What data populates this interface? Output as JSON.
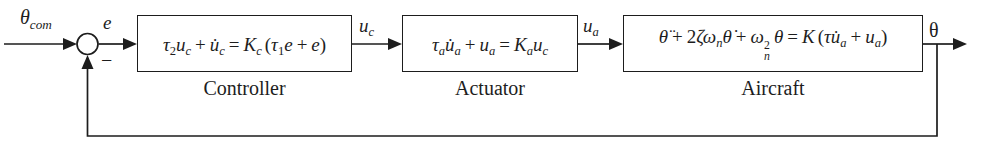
{
  "figure": {
    "background": "#ffffff",
    "ink": "#1d1d1d",
    "summing_junction": {
      "minus_label": "−"
    },
    "signals": {
      "input": {
        "tokens": [
          {
            "t": "θ",
            "sub": "com"
          }
        ]
      },
      "error": "e",
      "uc": {
        "tokens": [
          {
            "t": "u",
            "sub": "c"
          }
        ]
      },
      "ua": {
        "tokens": [
          {
            "t": "u",
            "sub": "a"
          }
        ]
      },
      "output": "θ"
    },
    "blocks": [
      {
        "name": "Controller",
        "equation": [
          {
            "t": "τ",
            "sub": "2"
          },
          {
            "t": "u",
            "sub": "c"
          },
          {
            "t": "+"
          },
          {
            "t": "u̇",
            "sub": "c"
          },
          {
            "t": "="
          },
          {
            "t": "K",
            "sub": "c"
          },
          {
            "t": "("
          },
          {
            "t": "τ",
            "sub": "1"
          },
          {
            "t": "e"
          },
          {
            "t": "+"
          },
          {
            "t": "e"
          },
          {
            "t": ")"
          }
        ]
      },
      {
        "name": "Actuator",
        "equation": [
          {
            "t": "τ",
            "sub": "a"
          },
          {
            "t": "u̇",
            "sub": "a"
          },
          {
            "t": "+"
          },
          {
            "t": "u",
            "sub": "a"
          },
          {
            "t": "="
          },
          {
            "t": "K",
            "sub": "a"
          },
          {
            "t": "u",
            "sub": "c"
          }
        ]
      },
      {
        "name": "Aircraft",
        "equation": [
          {
            "t": "θ̈"
          },
          {
            "t": "+"
          },
          {
            "t": "2"
          },
          {
            "t": "ζ"
          },
          {
            "t": "ω",
            "sub": "n"
          },
          {
            "t": "θ̇"
          },
          {
            "t": "+"
          },
          {
            "t": "ω",
            "sub": "n",
            "sup": "2"
          },
          {
            "t": "θ"
          },
          {
            "t": "="
          },
          {
            "t": "K"
          },
          {
            "t": "("
          },
          {
            "t": "τ"
          },
          {
            "t": "u̇",
            "sub": "a"
          },
          {
            "t": "+"
          },
          {
            "t": "u",
            "sub": "a"
          },
          {
            "t": ")"
          }
        ]
      }
    ]
  }
}
